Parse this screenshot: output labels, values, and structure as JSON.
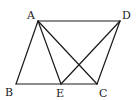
{
  "figure": {
    "type": "geometry",
    "points": {
      "A": {
        "label": "A",
        "x": 38,
        "y": 21,
        "lx": 27,
        "ly": 19
      },
      "D": {
        "label": "D",
        "x": 120,
        "y": 21,
        "lx": 122,
        "ly": 19
      },
      "B": {
        "label": "B",
        "x": 16,
        "y": 84,
        "lx": 5,
        "ly": 96
      },
      "E": {
        "label": "E",
        "x": 61,
        "y": 84,
        "lx": 56,
        "ly": 97
      },
      "C": {
        "label": "C",
        "x": 97,
        "y": 84,
        "lx": 99,
        "ly": 97
      }
    },
    "segments": [
      {
        "name": "AD",
        "from": "A",
        "to": "D"
      },
      {
        "name": "AB",
        "from": "A",
        "to": "B"
      },
      {
        "name": "BC",
        "from": "B",
        "to": "C"
      },
      {
        "name": "DC",
        "from": "D",
        "to": "C"
      },
      {
        "name": "AE",
        "from": "A",
        "to": "E"
      },
      {
        "name": "AC",
        "from": "A",
        "to": "C"
      },
      {
        "name": "DE",
        "from": "D",
        "to": "E"
      }
    ],
    "line_color": "#1a1a1a"
  }
}
